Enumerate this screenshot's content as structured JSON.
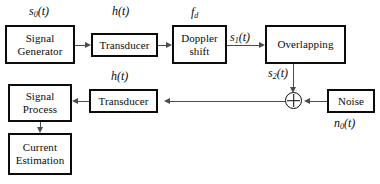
{
  "diagram": {
    "accent_color": "#0b0b0b",
    "line_color": "#4b4b4b",
    "blocks": [
      {
        "id": "signal-generator",
        "label": "Signal\nGenerator"
      },
      {
        "id": "transducer-tx",
        "label": "Transducer"
      },
      {
        "id": "doppler-shift",
        "label": "Doppler\nshift"
      },
      {
        "id": "overlapping",
        "label": "Overlapping"
      },
      {
        "id": "transducer-rx",
        "label": "Transducer"
      },
      {
        "id": "noise",
        "label": "Noise"
      },
      {
        "id": "signal-process",
        "label": "Signal\nProcess"
      },
      {
        "id": "current-estimation",
        "label": "Current\nEstimation"
      }
    ],
    "signals": {
      "s0": {
        "base": "s",
        "sub": "0",
        "arg": "(t)"
      },
      "h_tx": {
        "base": "h",
        "sub": "",
        "arg": "(t)"
      },
      "fd": {
        "base": "f",
        "sub": "d",
        "arg": ""
      },
      "s1": {
        "base": "s",
        "sub": "1",
        "arg": "(t)"
      },
      "s2": {
        "base": "s",
        "sub": "2",
        "arg": "(t)"
      },
      "h_rx": {
        "base": "h",
        "sub": "",
        "arg": "(t)"
      },
      "n0": {
        "base": "n",
        "sub": "0",
        "arg": "(t)"
      }
    },
    "sum_node": {
      "id": "summing-junction",
      "glyph": "+"
    }
  }
}
